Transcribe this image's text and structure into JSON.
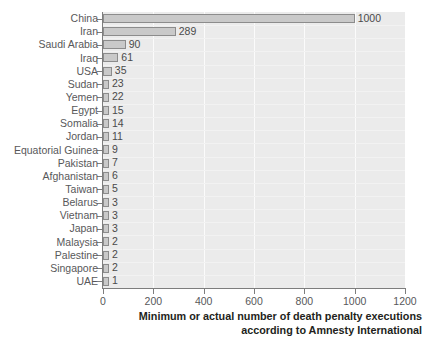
{
  "chart_data": {
    "type": "bar",
    "orientation": "horizontal",
    "title": "",
    "subtitle": "",
    "xlabel_line1": "Minimum or actual number of death penalty executions",
    "xlabel_line2": "according to Amnesty International",
    "ylabel": "",
    "xlim": [
      0,
      1200
    ],
    "xticks": [
      0,
      200,
      400,
      600,
      800,
      1000,
      1200
    ],
    "xtick_labels": [
      "0",
      "200",
      "400",
      "600",
      "800",
      "1000",
      "1200"
    ],
    "grid": "vertical",
    "legend": "none",
    "bar_fill_color": "#c9c9c9",
    "bar_border_color": "#8c8c8c",
    "plot_background_color": "#ebebeb",
    "gridline_color": "#fbfbfb",
    "axis_color": "#7d7d7d",
    "label_color": "#58585a",
    "title_color": "#231f20",
    "categories": [
      "China",
      "Iran",
      "Saudi Arabia",
      "Iraq",
      "USA",
      "Sudan",
      "Yemen",
      "Egypt",
      "Somalia",
      "Jordan",
      "Equatorial Guinea",
      "Pakistan",
      "Afghanistan",
      "Taiwan",
      "Belarus",
      "Vietnam",
      "Japan",
      "Malaysia",
      "Palestine",
      "Singapore",
      "UAE"
    ],
    "values": [
      1000,
      289,
      90,
      61,
      35,
      23,
      22,
      15,
      14,
      11,
      9,
      7,
      6,
      5,
      3,
      3,
      3,
      2,
      2,
      2,
      1
    ],
    "value_labels": [
      "1000",
      "289",
      "90",
      "61",
      "35",
      "23",
      "22",
      "15",
      "14",
      "11",
      "9",
      "7",
      "6",
      "5",
      "3",
      "3",
      "3",
      "2",
      "2",
      "2",
      "1"
    ]
  }
}
